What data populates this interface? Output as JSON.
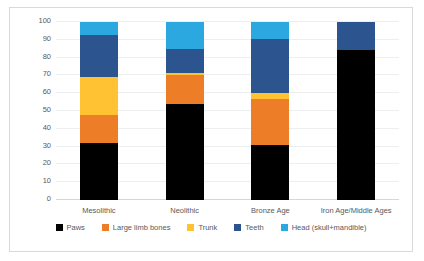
{
  "chart_data": {
    "type": "bar",
    "subtype": "stacked-bar-100",
    "title": "",
    "xlabel": "",
    "ylabel": "% bone fragments (NISP)",
    "ylim": [
      0,
      100
    ],
    "yticks": [
      0,
      10,
      20,
      30,
      40,
      50,
      60,
      70,
      80,
      90,
      100
    ],
    "ytick_labels": [
      "0",
      "10",
      "20",
      "30",
      "40",
      "50",
      "60",
      "70",
      "80",
      "90",
      "100"
    ],
    "grid": false,
    "legend_position": "bottom",
    "categories": [
      "Mesolithic",
      "Neolithic",
      "Bronze Age",
      "Iron Age/Middle Ages"
    ],
    "series": [
      {
        "name": "Paws",
        "color": "#000000",
        "values": [
          32,
          54,
          31,
          84
        ]
      },
      {
        "name": "Large limb bones",
        "color": "#ED7D26",
        "values": [
          16,
          16,
          25.5,
          0
        ]
      },
      {
        "name": "Trunk",
        "color": "#FFC233",
        "values": [
          21,
          1.5,
          3.5,
          0
        ]
      },
      {
        "name": "Teeth",
        "color": "#2C5590",
        "values": [
          23.5,
          13.5,
          30.5,
          16
        ]
      },
      {
        "name": "Head (skull+mandible)",
        "color": "#2CA8E0",
        "values": [
          7.5,
          15,
          9.5,
          0
        ]
      }
    ]
  },
  "colors": {
    "paws": "#000000",
    "large_limb_bones": "#ED7D26",
    "trunk": "#FFC233",
    "teeth": "#2C5590",
    "head": "#2CA8E0",
    "axis_text": "#595959",
    "border": "#d9d9d9"
  }
}
